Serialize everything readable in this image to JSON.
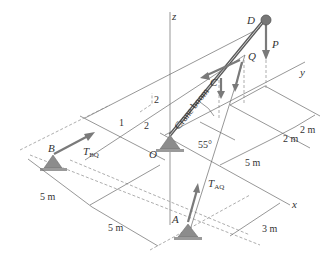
{
  "figure": {
    "axes": {
      "x": "x",
      "y": "y",
      "z": "z"
    },
    "points": {
      "A": "A",
      "B": "B",
      "C": "C",
      "D": "D",
      "O": "O",
      "Q": "Q"
    },
    "forces": {
      "P": "P",
      "T_AQ": "T",
      "T_AQ_sub": "AQ",
      "T_BQ": "T",
      "T_BQ_sub": "BQ"
    },
    "boom_label": "Crane boom",
    "angle": "55°",
    "slope": {
      "rise_1": "2",
      "run_1": "1",
      "run_2": "2"
    },
    "dimensions": {
      "left_top": "5 m",
      "left_bottom": "5 m",
      "right_mid": "5 m",
      "right_2a": "2 m",
      "right_2b": "2 m",
      "bottom_right": "3 m"
    }
  }
}
